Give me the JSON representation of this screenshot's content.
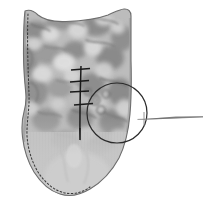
{
  "figure": {
    "caption": "Animal-head-shaped printed fabric panel, seam line basted, detail circled, hand needle at right",
    "background_color": "#ffffff",
    "width": 209,
    "height": 223
  },
  "fabric_panel": {
    "name": "fabric-panel",
    "description": "Cat/animal head shaped cut fabric piece with floral print",
    "outline_color": "#6e6e6e",
    "print_base_color": "#b8b8b8",
    "print_shadow_color": "#8f8f8f",
    "print_highlight_color": "#dcdcdc",
    "lower_area_color": "#c6c6c6",
    "shape_label": "animal head silhouette with two ear peaks"
  },
  "seam_line": {
    "name": "dashed-seam-line",
    "style": "dashed",
    "color": "#3a3a3a",
    "dash_pattern": "1.6 2.2",
    "description": "Seam allowance guide following the left and bottom contour"
  },
  "basting": {
    "name": "basting-stitch-line",
    "color": "#1a1a1a",
    "thread_label": "vertical basting thread",
    "cross_stitch_count": 4,
    "cross_stitch_label": "horizontal cross stitch"
  },
  "detail_circle": {
    "name": "detail-callout-circle",
    "color": "#2b2b2b",
    "center_x": 117,
    "center_y": 113,
    "radius": 30,
    "label": "detail callout"
  },
  "needle": {
    "name": "sewing-needle",
    "color": "#8a8a8a",
    "tip_x": 137,
    "tail_x": 203,
    "y": 119,
    "label": "hand sewing needle",
    "eye_mark_label": "needle eye cross mark"
  },
  "colors": {
    "ink": "#2b2b2b",
    "fabric_mid": "#b8b8b8",
    "fabric_dark": "#8f8f8f",
    "fabric_light": "#dcdcdc",
    "paper": "#ffffff"
  }
}
